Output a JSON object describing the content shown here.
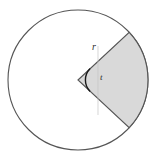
{
  "figure": {
    "background_color": "#ffffff",
    "labels": {
      "radius": "r",
      "angle": "t"
    },
    "circle": {
      "center_x": 78,
      "center_y": 80,
      "radius": 70,
      "stroke_color": "#555555",
      "stroke_width": 1,
      "fill_color": "#ffffff"
    },
    "sector": {
      "fill_color": "#d9d9d9",
      "stroke_color": "#555555",
      "stroke_width": 1,
      "start_angle_deg": -43,
      "end_angle_deg": 43,
      "upper_endpoint_x": 129,
      "upper_endpoint_y": 32,
      "lower_endpoint_x": 129,
      "lower_endpoint_y": 128
    },
    "angle_arc": {
      "radius": 16,
      "stroke_color": "#1a1a1a",
      "stroke_width": 1.4
    },
    "bisector_line": {
      "stroke_color": "#bdbdbd",
      "stroke_width": 0.8,
      "dashed": false
    }
  }
}
